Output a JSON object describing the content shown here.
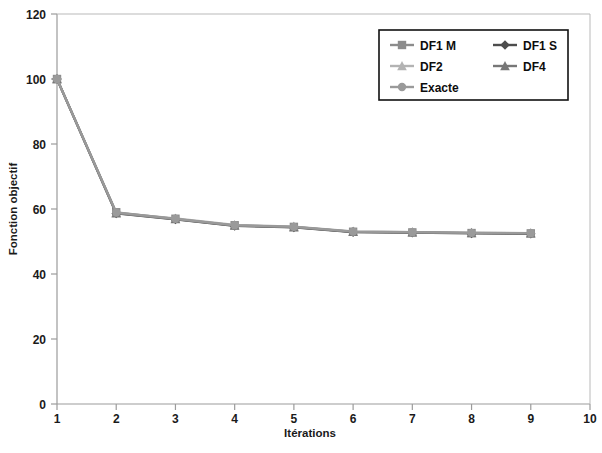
{
  "chart_data": {
    "type": "line",
    "title": "",
    "xlabel": "Itérations",
    "ylabel": "Fonction objectif",
    "x": [
      1,
      2,
      3,
      4,
      5,
      6,
      7,
      8,
      9
    ],
    "xlim": [
      1,
      10
    ],
    "ylim": [
      0,
      120
    ],
    "xticks": [
      "1",
      "2",
      "3",
      "4",
      "5",
      "6",
      "7",
      "8",
      "9",
      "10"
    ],
    "yticks": [
      "0",
      "20",
      "40",
      "60",
      "80",
      "100",
      "120"
    ],
    "grid": false,
    "legend_position": "upper right",
    "series": [
      {
        "name": "DF1 M",
        "marker": "square",
        "color": "#8c8c8c",
        "values": [
          100,
          59,
          57,
          55,
          54.5,
          53,
          52.8,
          52.6,
          52.5
        ]
      },
      {
        "name": "DF1 S",
        "marker": "diamond",
        "color": "#4d4d4d",
        "values": [
          100,
          58.6,
          56.8,
          54.8,
          54.3,
          52.9,
          52.7,
          52.5,
          52.4
        ]
      },
      {
        "name": "DF2",
        "marker": "triangle",
        "color": "#b3b3b3",
        "values": [
          100,
          58.8,
          57.1,
          55.1,
          54.6,
          53.1,
          52.9,
          52.7,
          52.6
        ]
      },
      {
        "name": "DF4",
        "marker": "triangle",
        "color": "#777777",
        "values": [
          100,
          58.7,
          56.9,
          54.9,
          54.4,
          53.0,
          52.8,
          52.6,
          52.5
        ]
      },
      {
        "name": "Exacte",
        "marker": "circle",
        "color": "#9a9a9a",
        "values": [
          100,
          58.9,
          57.0,
          55.0,
          54.5,
          53.05,
          52.85,
          52.65,
          52.55
        ]
      }
    ]
  },
  "legend": {
    "entries": [
      {
        "label": "DF1 M"
      },
      {
        "label": "DF1 S"
      },
      {
        "label": "DF2"
      },
      {
        "label": "DF4"
      },
      {
        "label": "Exacte"
      }
    ]
  }
}
